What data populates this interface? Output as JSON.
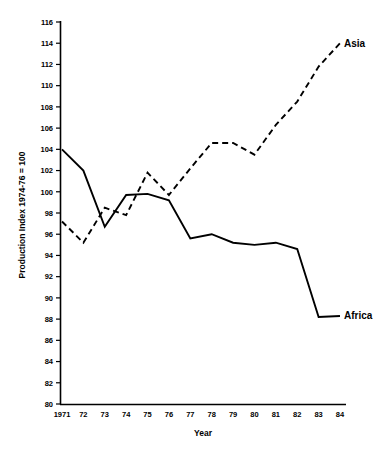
{
  "chart_data": {
    "type": "line",
    "title": "",
    "xlabel": "Year",
    "ylabel": "Production Index 1974-76 = 100",
    "x": [
      1971,
      1972,
      1973,
      1974,
      1975,
      1976,
      1977,
      1978,
      1979,
      1980,
      1981,
      1982,
      1983,
      1984
    ],
    "categories": [
      "1971",
      "72",
      "73",
      "74",
      "75",
      "76",
      "77",
      "78",
      "79",
      "80",
      "81",
      "82",
      "83",
      "84"
    ],
    "series": [
      {
        "name": "Asia",
        "style": "dashed",
        "color": "#000000",
        "values": [
          97.2,
          95.2,
          98.5,
          97.8,
          101.8,
          99.7,
          102.2,
          104.6,
          104.6,
          103.5,
          106.3,
          108.5,
          111.8,
          114.0
        ]
      },
      {
        "name": "Africa",
        "style": "solid",
        "color": "#000000",
        "values": [
          104.0,
          102.0,
          96.7,
          99.7,
          99.8,
          99.2,
          95.6,
          96.0,
          95.2,
          95.0,
          95.2,
          94.6,
          88.2,
          88.3
        ]
      }
    ],
    "ylim": [
      80,
      116
    ],
    "ytick_step": 2,
    "yticks": [
      80,
      82,
      84,
      86,
      88,
      90,
      92,
      94,
      96,
      98,
      100,
      102,
      104,
      106,
      108,
      110,
      112,
      114,
      116
    ],
    "ytick_labels": [
      "80",
      "82",
      "84",
      "86",
      "88",
      "90",
      "92",
      "94",
      "96",
      "98",
      "100",
      "102",
      "104",
      "106",
      "108",
      "110",
      "112",
      "114",
      "116"
    ],
    "grid": false,
    "legend_position": "inline-end-of-line",
    "annotations": [
      {
        "text": "Asia",
        "series": "Asia",
        "anchor_year": 1984,
        "anchor_value": 114.0
      },
      {
        "text": "Africa",
        "series": "Africa",
        "anchor_year": 1984,
        "anchor_value": 88.3
      }
    ]
  }
}
